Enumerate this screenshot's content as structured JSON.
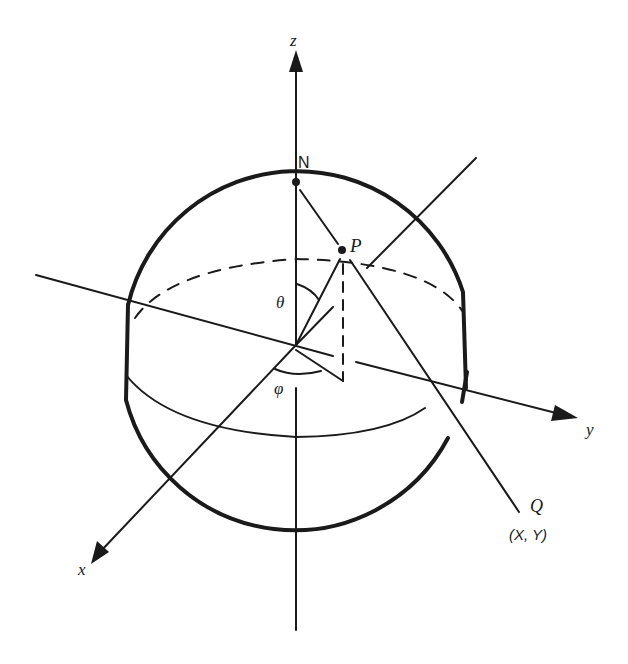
{
  "diagram": {
    "type": "stereographic-projection-sphere",
    "labels": {
      "z_axis": "z",
      "y_axis": "y",
      "x_axis": "x",
      "north_pole": "N",
      "point_p": "P",
      "polar_angle": "θ",
      "azimuth_angle": "φ",
      "point_q": "Q",
      "q_coords": "(X, Y)"
    },
    "colors": {
      "ink": "#1a1a1a",
      "background": "#ffffff"
    }
  }
}
